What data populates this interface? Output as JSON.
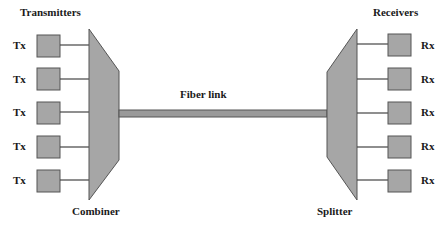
{
  "titles": {
    "transmitters": "Transmitters",
    "receivers": "Receivers",
    "fiber_link": "Fiber link",
    "combiner": "Combiner",
    "splitter": "Splitter"
  },
  "transmitters": [
    {
      "label": "Tx"
    },
    {
      "label": "Tx"
    },
    {
      "label": "Tx"
    },
    {
      "label": "Tx"
    },
    {
      "label": "Tx"
    }
  ],
  "receivers": [
    {
      "label": "Rx"
    },
    {
      "label": "Rx"
    },
    {
      "label": "Rx"
    },
    {
      "label": "Rx"
    },
    {
      "label": "Rx"
    }
  ],
  "colors": {
    "box_fill": "#a6a6a6",
    "box_stroke": "#555555",
    "line": "#444444",
    "text": "#1a1a1a"
  }
}
